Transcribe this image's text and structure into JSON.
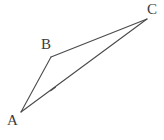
{
  "figure": {
    "kind": "geometry-diagram",
    "shape": "triangle",
    "width": 164,
    "height": 140,
    "background_color": "#ffffff",
    "stroke_color": "#4a4a4a",
    "stroke_width": 1.1,
    "label_color": "#3b3b3b",
    "label_font_size": 15,
    "vertices": [
      {
        "id": "A",
        "label": "A",
        "x": 21,
        "y": 112,
        "label_x": 7,
        "label_y": 113
      },
      {
        "id": "B",
        "label": "B",
        "x": 51,
        "y": 57,
        "label_x": 41,
        "label_y": 37
      },
      {
        "id": "C",
        "label": "C",
        "x": 147,
        "y": 19,
        "label_x": 147,
        "label_y": 2
      }
    ],
    "edges": [
      {
        "id": "AB",
        "from": "A",
        "to": "B",
        "x1": 21,
        "y1": 112,
        "x2": 51,
        "y2": 57
      },
      {
        "id": "BC",
        "from": "B",
        "to": "C",
        "x1": 51,
        "y1": 57,
        "x2": 147,
        "y2": 19
      },
      {
        "id": "AC",
        "from": "A",
        "to": "C",
        "x1": 21,
        "y1": 112,
        "x2": 147,
        "y2": 19
      }
    ],
    "tick_marks": [
      {
        "id": "tick-AC",
        "on_edge": "AC",
        "x": 53,
        "y": 89,
        "length": 6,
        "angle_deg": -36
      }
    ]
  }
}
